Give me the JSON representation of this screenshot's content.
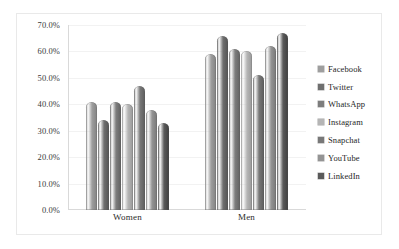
{
  "chart_data": {
    "type": "bar",
    "title": "",
    "subtitle": "",
    "xlabel": "",
    "ylabel": "",
    "categories": [
      "Women",
      "Men"
    ],
    "ylim": [
      0,
      0.7
    ],
    "y_ticks": [
      "0.0%",
      "10.0%",
      "20.0%",
      "30.0%",
      "40.0%",
      "50.0%",
      "60.0%",
      "70.0%"
    ],
    "y_tick_values": [
      0,
      10,
      20,
      30,
      40,
      50,
      60,
      70
    ],
    "grid": true,
    "legend_position": "right",
    "series": [
      {
        "name": "Facebook",
        "values": [
          41,
          59
        ],
        "color": "#9e9e9e"
      },
      {
        "name": "Twitter",
        "values": [
          34,
          66
        ],
        "color": "#6f6f6f"
      },
      {
        "name": "WhatsApp",
        "values": [
          41,
          61
        ],
        "color": "#7d7d7d"
      },
      {
        "name": "Instagram",
        "values": [
          40,
          60
        ],
        "color": "#b5b5b5"
      },
      {
        "name": "Snapchat",
        "values": [
          47,
          51
        ],
        "color": "#787878"
      },
      {
        "name": "YouTube",
        "values": [
          38,
          62
        ],
        "color": "#949494"
      },
      {
        "name": "LinkedIn",
        "values": [
          33,
          67
        ],
        "color": "#5a5a5a"
      }
    ]
  },
  "legend": {
    "items": [
      {
        "label": "Facebook"
      },
      {
        "label": "Twitter"
      },
      {
        "label": "WhatsApp"
      },
      {
        "label": "Instagram"
      },
      {
        "label": "Snapchat"
      },
      {
        "label": "YouTube"
      },
      {
        "label": "LinkedIn"
      }
    ]
  }
}
